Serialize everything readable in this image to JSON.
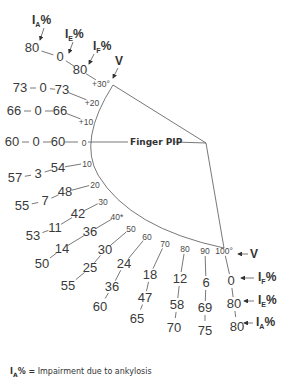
{
  "joint_label": "Finger PIP",
  "headers": {
    "ia": {
      "main": "I",
      "sub": "A",
      "suffix": "%"
    },
    "ie": {
      "main": "I",
      "sub": "E",
      "suffix": "%"
    },
    "if": {
      "main": "I",
      "sub": "F",
      "suffix": "%"
    },
    "v": "V"
  },
  "rows": [
    {
      "angle": "+30°",
      "if": "80",
      "ie": "0",
      "ia": "80"
    },
    {
      "angle": "+20",
      "if": "73",
      "ie": "0",
      "ia": "73"
    },
    {
      "angle": "+10",
      "if": "66",
      "ie": "0",
      "ia": "66"
    },
    {
      "angle": "0",
      "if": "60",
      "ie": "0",
      "ia": "60"
    },
    {
      "angle": "10",
      "if": "54",
      "ie": "3",
      "ia": "57"
    },
    {
      "angle": "20",
      "if": "48",
      "ie": "7",
      "ia": "55"
    },
    {
      "angle": "30",
      "if": "42",
      "ie": "11",
      "ia": "53"
    },
    {
      "angle": "40*",
      "if": "36",
      "ie": "14",
      "ia": "50"
    },
    {
      "angle": "50",
      "if": "30",
      "ie": "25",
      "ia": "55"
    },
    {
      "angle": "60",
      "if": "24",
      "ie": "36",
      "ia": "60"
    },
    {
      "angle": "70",
      "if": "18",
      "ie": "47",
      "ia": "65"
    },
    {
      "angle": "80",
      "if": "12",
      "ie": "58",
      "ia": "70"
    },
    {
      "angle": "90",
      "if": "6",
      "ie": "69",
      "ia": "75"
    },
    {
      "angle": "100°",
      "if": "0",
      "ie": "80",
      "ia": "80"
    }
  ],
  "legend": {
    "symbol_main": "I",
    "symbol_sub": "A",
    "symbol_suffix": "% =",
    "text": "Impairment due to ankylosis"
  }
}
